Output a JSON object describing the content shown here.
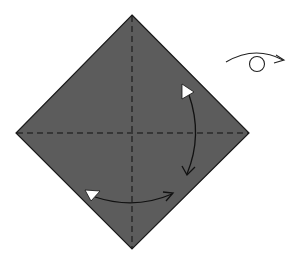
{
  "diagram": {
    "type": "origami-step",
    "paper": {
      "shape": "square-diamond",
      "fill": "#5c5c5c",
      "stroke": "#1a1a1a",
      "vertices": {
        "top": [
          132,
          15
        ],
        "right": [
          249,
          133
        ],
        "bottom": [
          132,
          249
        ],
        "left": [
          16,
          133
        ]
      }
    },
    "creases": [
      {
        "name": "vertical-valley-fold",
        "style": "dashed",
        "from": [
          132,
          15
        ],
        "to": [
          132,
          249
        ]
      },
      {
        "name": "horizontal-valley-fold",
        "style": "dashed",
        "from": [
          16,
          133
        ],
        "to": [
          249,
          133
        ]
      }
    ],
    "arrows": [
      {
        "name": "fold-right-corner-down",
        "meaning": "fold and unfold"
      },
      {
        "name": "fold-bottom-corner-right",
        "meaning": "fold and unfold"
      }
    ],
    "symbols": [
      {
        "name": "turn-over",
        "meaning": "turn the model over"
      }
    ],
    "colors": {
      "paper": "#5c5c5c",
      "line": "#1a1a1a",
      "arrow_head_fill": "#ffffff"
    }
  }
}
